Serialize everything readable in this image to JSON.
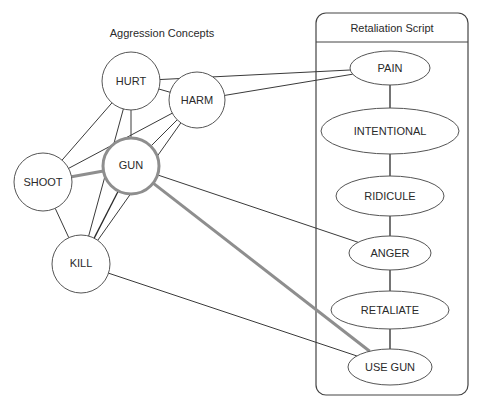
{
  "diagram": {
    "left_group": {
      "title": "Aggression Concepts",
      "nodes": [
        {
          "id": "hurt",
          "label": "HURT",
          "cx": 131,
          "cy": 81,
          "r": 29,
          "highlighted": false
        },
        {
          "id": "harm",
          "label": "HARM",
          "cx": 197,
          "cy": 100,
          "r": 28,
          "highlighted": false
        },
        {
          "id": "shoot",
          "label": "SHOOT",
          "cx": 43,
          "cy": 182,
          "r": 29,
          "highlighted": false
        },
        {
          "id": "gun",
          "label": "GUN",
          "cx": 131,
          "cy": 166,
          "r": 28,
          "highlighted": true
        },
        {
          "id": "kill",
          "label": "KILL",
          "cx": 81,
          "cy": 264,
          "r": 29,
          "highlighted": false
        }
      ]
    },
    "right_group": {
      "title": "Retaliation Script",
      "box": {
        "x": 316,
        "y": 13,
        "width": 152,
        "height": 382,
        "header_y": 42
      },
      "nodes": [
        {
          "id": "pain",
          "label": "PAIN",
          "cx": 390,
          "cy": 68,
          "rx": 40,
          "ry": 17
        },
        {
          "id": "intentional",
          "label": "INTENTIONAL",
          "cx": 390,
          "cy": 131,
          "rx": 69,
          "ry": 23
        },
        {
          "id": "ridicule",
          "label": "RIDICULE",
          "cx": 390,
          "cy": 196,
          "rx": 54,
          "ry": 20
        },
        {
          "id": "anger",
          "label": "ANGER",
          "cx": 390,
          "cy": 253,
          "rx": 41,
          "ry": 17
        },
        {
          "id": "retaliate",
          "label": "RETALIATE",
          "cx": 390,
          "cy": 310,
          "rx": 59,
          "ry": 19
        },
        {
          "id": "use_gun",
          "label": "USE GUN",
          "cx": 390,
          "cy": 367,
          "rx": 42,
          "ry": 18
        }
      ]
    },
    "edges": [
      {
        "from": "hurt",
        "to": "harm",
        "style": "thin"
      },
      {
        "from": "hurt",
        "to": "shoot",
        "style": "thin"
      },
      {
        "from": "hurt",
        "to": "gun",
        "style": "thin"
      },
      {
        "from": "hurt",
        "to": "kill",
        "style": "thin"
      },
      {
        "from": "harm",
        "to": "shoot",
        "style": "thin"
      },
      {
        "from": "harm",
        "to": "gun",
        "style": "thin"
      },
      {
        "from": "harm",
        "to": "kill",
        "style": "thin"
      },
      {
        "from": "shoot",
        "to": "gun",
        "style": "gray"
      },
      {
        "from": "shoot",
        "to": "kill",
        "style": "thin"
      },
      {
        "from": "gun",
        "to": "kill",
        "style": "dark"
      },
      {
        "from": "hurt",
        "to": "pain",
        "style": "thin"
      },
      {
        "from": "harm",
        "to": "pain",
        "style": "thin"
      },
      {
        "from": "gun",
        "to": "anger",
        "style": "thin"
      },
      {
        "from": "gun",
        "to": "use_gun",
        "style": "gray"
      },
      {
        "from": "kill",
        "to": "use_gun",
        "style": "thin"
      }
    ],
    "script_sequence": [
      "pain",
      "intentional",
      "ridicule",
      "anger",
      "retaliate",
      "use_gun"
    ],
    "colors": {
      "highlight_stroke": "#8e8e8e",
      "line": "#3a3a3a",
      "text": "#2a2a2a"
    }
  }
}
